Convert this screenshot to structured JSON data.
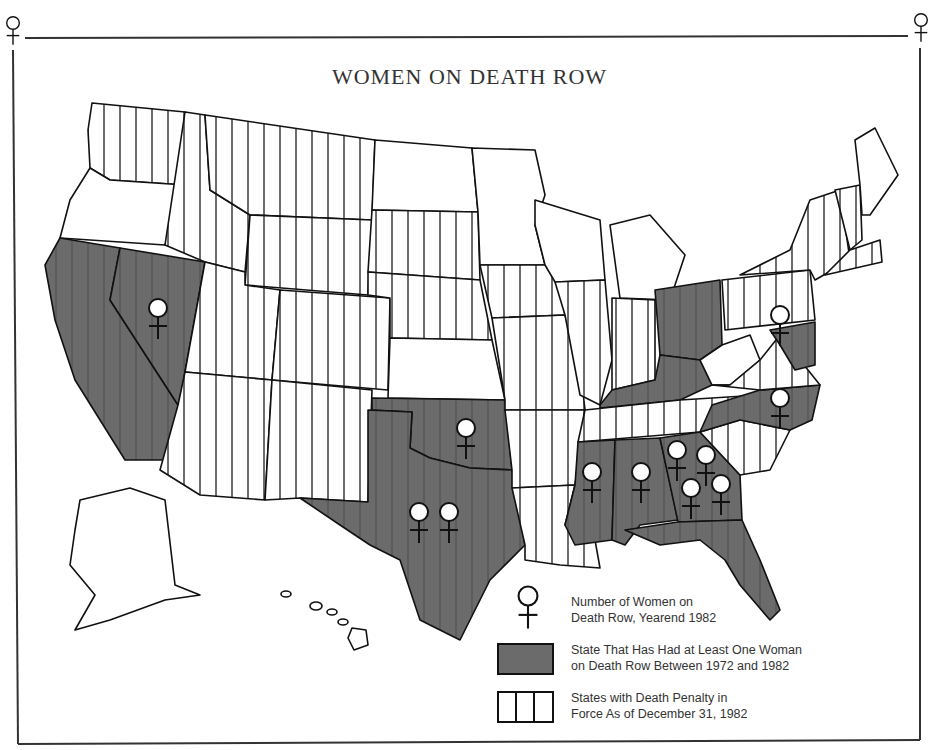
{
  "title": "WOMEN ON DEATH ROW",
  "colors": {
    "had_woman_fill": "#6b6b6b",
    "hatch_line": "#2e2e2e",
    "border": "#333333",
    "background": "#ffffff"
  },
  "legend": {
    "items": [
      {
        "symbol": "female-symbol",
        "text_line1": "Number of Women on",
        "text_line2": "Death Row, Yearend 1982"
      },
      {
        "symbol": "gray-box",
        "text_line1": "State That Has Had at Least One Woman",
        "text_line2": "on Death Row Between 1972 and 1982"
      },
      {
        "symbol": "hatched-box",
        "text_line1": "States with Death Penalty in",
        "text_line2": "Force As of December 31, 1982"
      }
    ]
  },
  "map_data": {
    "women_on_death_row_yearend_1982": [
      {
        "state": "Nevada",
        "count": 1
      },
      {
        "state": "Oklahoma",
        "count": 1
      },
      {
        "state": "Texas",
        "count": 2
      },
      {
        "state": "Mississippi",
        "count": 1
      },
      {
        "state": "Alabama",
        "count": 1
      },
      {
        "state": "Georgia",
        "count": 4
      },
      {
        "state": "North Carolina",
        "count": 1
      },
      {
        "state": "Maryland",
        "count": 1
      }
    ],
    "had_woman_1972_1982": [
      "California",
      "Nevada",
      "Texas",
      "Oklahoma",
      "Ohio",
      "Kentucky",
      "North Carolina",
      "Mississippi",
      "Alabama",
      "Georgia",
      "Florida",
      "Maryland"
    ],
    "death_penalty_in_force_1982": [
      "Washington",
      "Montana",
      "Idaho",
      "Wyoming",
      "Utah",
      "Colorado",
      "Arizona",
      "New Mexico",
      "Nebraska",
      "South Dakota",
      "Missouri",
      "Arkansas",
      "Louisiana",
      "Illinois",
      "Indiana",
      "Tennessee",
      "South Carolina",
      "Virginia",
      "Pennsylvania",
      "Connecticut",
      "New Hampshire",
      "Vermont",
      "New Jersey",
      "Delaware",
      "California",
      "Nevada",
      "Texas",
      "Oklahoma",
      "Ohio",
      "Kentucky",
      "North Carolina",
      "Mississippi",
      "Alabama",
      "Georgia",
      "Florida",
      "Maryland"
    ]
  }
}
